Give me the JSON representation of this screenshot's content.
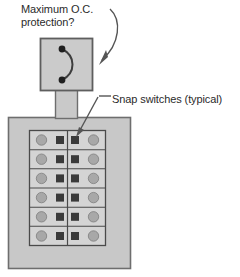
{
  "diagram": {
    "title_text_1": "Maximum O.C.\nprotection?",
    "title_text_2": "Snap switches (typical)",
    "annotations": [
      {
        "name": "maximum-oc-protection-label",
        "text": "Maximum O.C.\nprotection?",
        "points_to": "disconnect-box",
        "arrow_style": "curved"
      },
      {
        "name": "snap-switches-label",
        "text": "Snap switches (typical)",
        "points_to": "switch-grid-cell-row1-right",
        "arrow_style": "straight-with-leader"
      }
    ],
    "components": {
      "disconnect_box": {
        "name": "disconnect-box",
        "symbol": "circuit-breaker-symbol",
        "terminals": 2
      },
      "conduit": {
        "name": "conduit-raceway"
      },
      "panel": {
        "name": "switch-panel-enclosure",
        "grid": {
          "rows": 6,
          "columns": 2,
          "cell_contents": [
            "circle-knob",
            "square-switch"
          ],
          "right_column_mirrored": true
        }
      }
    },
    "colors": {
      "panel_fill": "#c8c8c8",
      "panel_stroke": "#6e6e6e",
      "grid_fill": "#d6d6d6",
      "cell_fill": "#d0d0d0",
      "circle_fill": "#a8a8a8",
      "square_fill": "#3a3a3a",
      "line": "#4a4a4a",
      "text": "#2b2b2b",
      "background": "#ffffff"
    }
  }
}
